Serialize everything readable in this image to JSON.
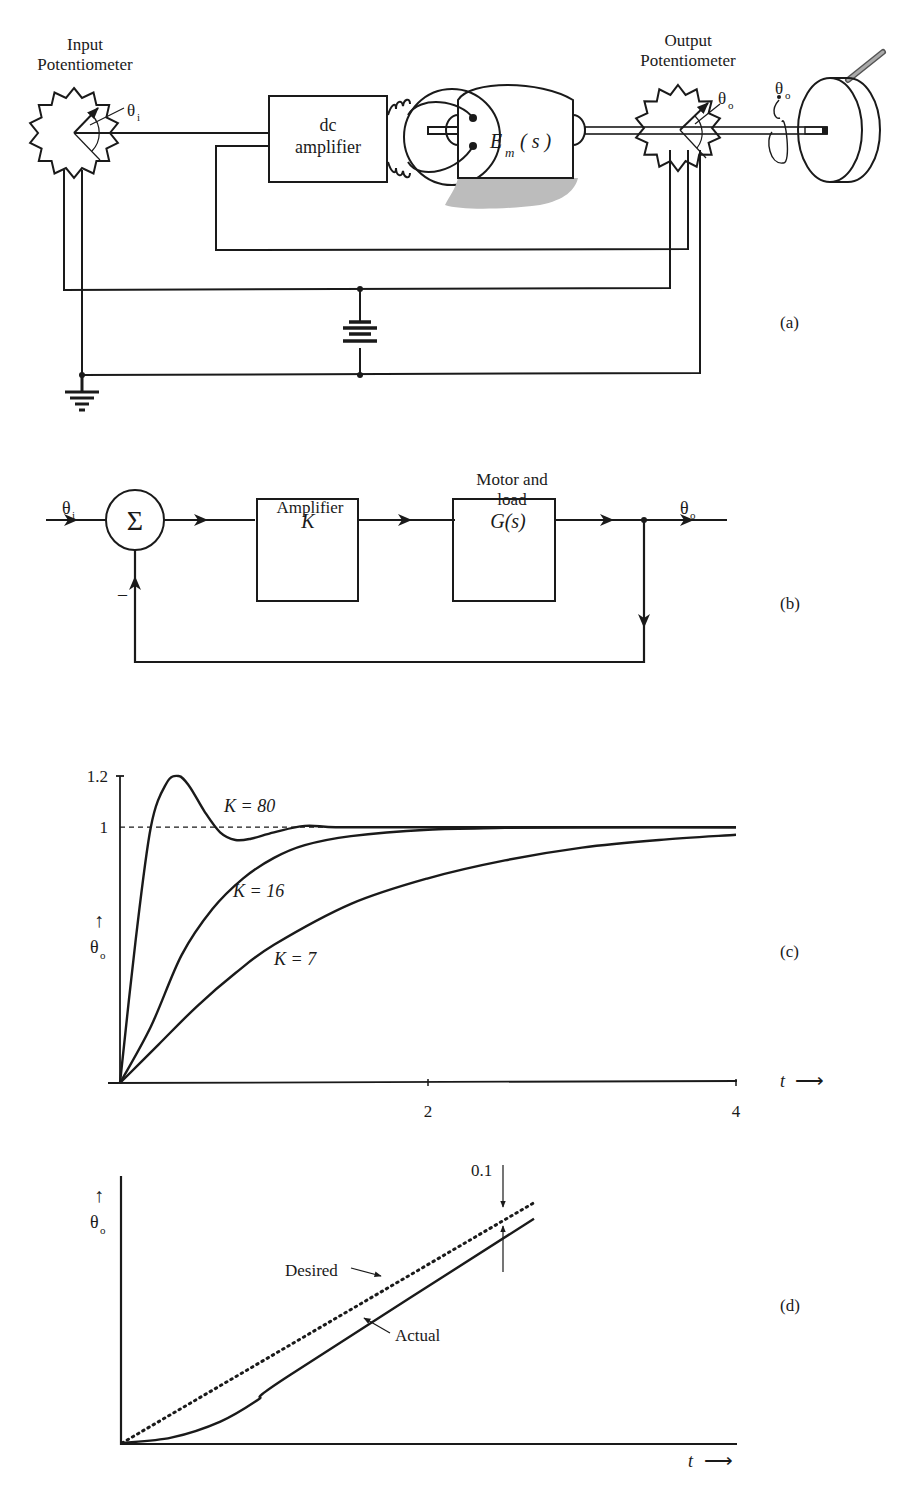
{
  "panel_a": {
    "input_pot_label_line1": "Input",
    "input_pot_label_line2": "Potentiometer",
    "input_angle_label": "θ",
    "input_angle_sub": "i",
    "amplifier_line1": "dc",
    "amplifier_line2": "amplifier",
    "motor_label": "E",
    "motor_sub": "m",
    "motor_arg": "( s )",
    "output_pot_label_line1": "Output",
    "output_pot_label_line2": "Potentiometer",
    "output_angle_label": "θ",
    "output_angle_sub": "o",
    "rotation_label": "θ",
    "rotation_sub": "o",
    "panel_tag": "(a)"
  },
  "panel_b": {
    "input_label": "θ",
    "input_sub": "i",
    "summer_symbol": "Σ",
    "minus_sign": "–",
    "amplifier_title": "Amplifier",
    "amplifier_block": "K",
    "plant_title_line1": "Motor and",
    "plant_title_line2": "load",
    "plant_block": "G(s)",
    "output_label": "θ",
    "output_sub": "o",
    "panel_tag": "(b)",
    "block_fill": "#e3e3e3"
  },
  "panel_c": {
    "panel_tag": "(c)",
    "ylabel_arrow": "↑",
    "ylabel": "θ",
    "ylabel_sub": "o",
    "xlabel": "t",
    "xlabel_arrow": "⟶"
  },
  "panel_d": {
    "panel_tag": "(d)",
    "ylabel_arrow": "↑",
    "ylabel": "θ",
    "ylabel_sub": "o",
    "xlabel": "t",
    "xlabel_arrow": "⟶",
    "desired_label": "Desired",
    "actual_label": "Actual",
    "error_label": "0.1"
  },
  "chart_data": [
    {
      "type": "line",
      "title": "",
      "xlabel": "t",
      "ylabel": "θo",
      "xlim": [
        0,
        4
      ],
      "ylim": [
        0,
        1.2
      ],
      "x_ticks": [
        "2",
        "4"
      ],
      "y_ticks": [
        "1",
        "1.2"
      ],
      "reference_line": {
        "y": 1,
        "style": "dashed"
      },
      "series": [
        {
          "name": "K = 80",
          "x": [
            0,
            0.1,
            0.2,
            0.3,
            0.38,
            0.45,
            0.55,
            0.65,
            0.75,
            0.85,
            1.0,
            1.2,
            1.4,
            1.8,
            2.5,
            4.0
          ],
          "y": [
            0,
            0.55,
            1.0,
            1.17,
            1.2,
            1.16,
            1.06,
            0.98,
            0.95,
            0.955,
            0.98,
            1.005,
            1.0,
            1.0,
            1.0,
            1.0
          ]
        },
        {
          "name": "K = 16",
          "x": [
            0,
            0.2,
            0.4,
            0.6,
            0.8,
            1.0,
            1.2,
            1.5,
            2.0,
            2.5,
            3.0,
            4.0
          ],
          "y": [
            0,
            0.22,
            0.5,
            0.68,
            0.8,
            0.88,
            0.93,
            0.965,
            0.99,
            0.997,
            1.0,
            1.0
          ]
        },
        {
          "name": "K = 7",
          "x": [
            0,
            0.25,
            0.5,
            0.75,
            1.0,
            1.5,
            2.0,
            2.5,
            3.0,
            3.5,
            4.0
          ],
          "y": [
            0,
            0.15,
            0.3,
            0.43,
            0.54,
            0.7,
            0.8,
            0.87,
            0.92,
            0.95,
            0.97
          ]
        }
      ],
      "annotations": [
        "K = 80",
        "K = 16",
        "K = 7"
      ]
    },
    {
      "type": "line",
      "title": "",
      "xlabel": "t",
      "ylabel": "θo",
      "xlim": [
        0,
        1
      ],
      "ylim": [
        0,
        1
      ],
      "series": [
        {
          "name": "Desired",
          "style": "dotted",
          "x": [
            0,
            0.67
          ],
          "y": [
            0,
            0.9
          ]
        },
        {
          "name": "Actual",
          "style": "solid",
          "x": [
            0,
            0.08,
            0.16,
            0.22,
            0.27,
            0.67
          ],
          "y": [
            0,
            0.02,
            0.08,
            0.16,
            0.25,
            0.84
          ]
        }
      ],
      "annotations": [
        "Desired",
        "Actual",
        "0.1"
      ]
    }
  ]
}
